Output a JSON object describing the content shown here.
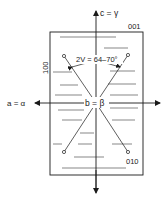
{
  "figure": {
    "type": "optical-orientation-diagram",
    "labels": {
      "c_axis": "c = γ",
      "a_axis": "a = α",
      "b_axis": "b = β",
      "optic_angle": "2V = 64–70°",
      "face_001": "001",
      "face_100": "100",
      "face_010": "010"
    },
    "colors": {
      "line": "#1a1a1a",
      "cleavage": "#555555",
      "background": "#ffffff"
    }
  }
}
